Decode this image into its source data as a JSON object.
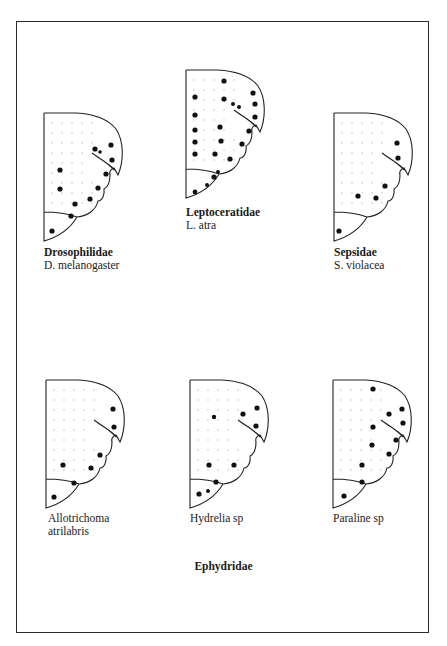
{
  "figure": {
    "panels": [
      {
        "id": "drosophilidae",
        "family": "Drosophilidae",
        "species": "D. melanogaster",
        "origin": [
          44,
          113
        ],
        "label_pos": [
          44,
          246
        ],
        "dots": [
          [
            67,
            32,
            2.6
          ],
          [
            51,
            36,
            2.6
          ],
          [
            56,
            39,
            1.8
          ],
          [
            68,
            47,
            2.6
          ],
          [
            16,
            57,
            2.6
          ],
          [
            62,
            61,
            2.6
          ],
          [
            16,
            76,
            2.6
          ],
          [
            54,
            75,
            2.6
          ],
          [
            46,
            86,
            2.6
          ],
          [
            31,
            91,
            2.6
          ],
          [
            27,
            103,
            2.6
          ],
          [
            8,
            118,
            2.6
          ]
        ]
      },
      {
        "id": "leptoceratidae",
        "family": "Leptoceratidae",
        "species": "L. atra",
        "origin": [
          186,
          70
        ],
        "label_pos": [
          186,
          206
        ],
        "dots": [
          [
            38,
            11,
            2.6
          ],
          [
            67,
            23,
            2.6
          ],
          [
            9,
            27,
            2.6
          ],
          [
            38,
            29,
            2.6
          ],
          [
            47,
            34,
            2
          ],
          [
            53,
            37,
            2
          ],
          [
            69,
            34,
            2.6
          ],
          [
            9,
            45,
            2.6
          ],
          [
            69,
            47,
            2.6
          ],
          [
            34,
            57,
            2.6
          ],
          [
            9,
            60,
            2.6
          ],
          [
            63,
            61,
            2.6
          ],
          [
            35,
            71,
            2.6
          ],
          [
            9,
            72,
            2.6
          ],
          [
            56,
            74,
            2.6
          ],
          [
            9,
            84,
            2.6
          ],
          [
            29,
            84,
            2.6
          ],
          [
            44,
            89,
            2.6
          ],
          [
            32,
            102,
            2
          ],
          [
            28,
            107,
            2.6
          ],
          [
            21,
            115,
            2
          ],
          [
            9,
            122,
            2.4
          ]
        ]
      },
      {
        "id": "sepsidae",
        "family": "Sepsidae",
        "species": "S. violacea",
        "origin": [
          334,
          113
        ],
        "label_pos": [
          334,
          246
        ],
        "dots": [
          [
            63,
            30,
            2.6
          ],
          [
            64,
            45,
            2.6
          ],
          [
            51,
            73,
            2.6
          ],
          [
            24,
            83,
            2.6
          ],
          [
            42,
            85,
            2.6
          ],
          [
            5,
            118,
            2.6
          ]
        ]
      },
      {
        "id": "allotrichoma",
        "family": "",
        "species": "Allotrichoma\natrilabris",
        "origin": [
          46,
          380
        ],
        "label_pos": [
          48,
          512
        ],
        "dots": [
          [
            67,
            29,
            2.6
          ],
          [
            68,
            47,
            2.6
          ],
          [
            54,
            75,
            2.6
          ],
          [
            17,
            85,
            2.6
          ],
          [
            45,
            88,
            2.6
          ],
          [
            28,
            103,
            2.6
          ],
          [
            8,
            117,
            2.6
          ]
        ]
      },
      {
        "id": "hydrelia",
        "family": "",
        "species": "Hydrelia sp",
        "origin": [
          190,
          380
        ],
        "label_pos": [
          190,
          512
        ],
        "dots": [
          [
            24,
            37,
            2.2
          ],
          [
            53,
            34,
            2.6
          ],
          [
            67,
            28,
            2.6
          ],
          [
            66,
            46,
            2.6
          ],
          [
            19,
            85,
            2.6
          ],
          [
            44,
            85,
            2.6
          ],
          [
            26,
            102,
            2.6
          ],
          [
            18,
            111,
            2
          ],
          [
            9,
            114,
            2.6
          ]
        ]
      },
      {
        "id": "paraline",
        "family": "",
        "species": "Paraline sp",
        "origin": [
          333,
          380
        ],
        "label_pos": [
          333,
          512
        ],
        "dots": [
          [
            40,
            9,
            2.6
          ],
          [
            56,
            34,
            2.6
          ],
          [
            69,
            29,
            2.6
          ],
          [
            70,
            43,
            2.6
          ],
          [
            40,
            47,
            2.6
          ],
          [
            63,
            60,
            2.6
          ],
          [
            39,
            65,
            2.6
          ],
          [
            56,
            74,
            2.6
          ],
          [
            29,
            85,
            2.6
          ],
          [
            29,
            102,
            2.6
          ],
          [
            11,
            116,
            2.6
          ]
        ]
      }
    ],
    "group_label": "Ephydridae"
  }
}
